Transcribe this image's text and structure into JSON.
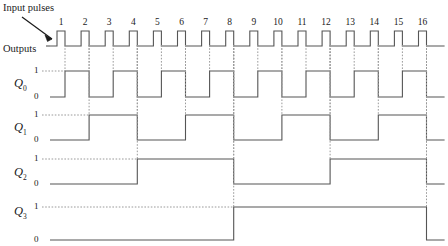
{
  "figure": {
    "kind": "timing-diagram",
    "title_note": "Input pulses",
    "outputs_label": "Outputs",
    "annotations": {
      "input_pulses": "Input pulses",
      "outputs": "Outputs"
    }
  },
  "clock": {
    "label": "Input pulses",
    "pulse_numbers": [
      "1",
      "2",
      "3",
      "4",
      "5",
      "6",
      "7",
      "8",
      "9",
      "10",
      "11",
      "12",
      "13",
      "14",
      "15",
      "16"
    ],
    "pulse_count": 16,
    "active_level": "high",
    "trigger_edge": "falling"
  },
  "signals": [
    {
      "name": "Q",
      "index": "0",
      "high_label": "1",
      "low_label": "0",
      "divide_by": 1,
      "initial": 0
    },
    {
      "name": "Q",
      "index": "1",
      "high_label": "1",
      "low_label": "0",
      "divide_by": 2,
      "initial": 0
    },
    {
      "name": "Q",
      "index": "2",
      "high_label": "1",
      "low_label": "0",
      "divide_by": 4,
      "initial": 0
    },
    {
      "name": "Q",
      "index": "3",
      "high_label": "1",
      "low_label": "0",
      "divide_by": 8,
      "initial": 0
    }
  ],
  "chart_data": {
    "type": "line",
    "title": "",
    "xlabel": "",
    "ylabel": "",
    "grid": false,
    "x": [
      1,
      2,
      3,
      4,
      5,
      6,
      7,
      8,
      9,
      10,
      11,
      12,
      13,
      14,
      15,
      16
    ],
    "series": [
      {
        "name": "Input pulses",
        "values": [
          1,
          1,
          1,
          1,
          1,
          1,
          1,
          1,
          1,
          1,
          1,
          1,
          1,
          1,
          1,
          1
        ]
      },
      {
        "name": "Q0",
        "values": [
          1,
          0,
          1,
          0,
          1,
          0,
          1,
          0,
          1,
          0,
          1,
          0,
          1,
          0,
          1,
          0
        ]
      },
      {
        "name": "Q1",
        "values": [
          0,
          1,
          1,
          0,
          0,
          1,
          1,
          0,
          0,
          1,
          1,
          0,
          0,
          1,
          1,
          0
        ]
      },
      {
        "name": "Q2",
        "values": [
          0,
          0,
          0,
          1,
          1,
          1,
          1,
          0,
          0,
          0,
          0,
          1,
          1,
          1,
          1,
          0
        ]
      },
      {
        "name": "Q3",
        "values": [
          0,
          0,
          0,
          0,
          0,
          0,
          0,
          1,
          1,
          1,
          1,
          1,
          1,
          1,
          1,
          0
        ]
      }
    ]
  },
  "style": {
    "line_color": "#555555",
    "text_color": "#1a1a1a",
    "dash_color": "#9a9a9a"
  }
}
